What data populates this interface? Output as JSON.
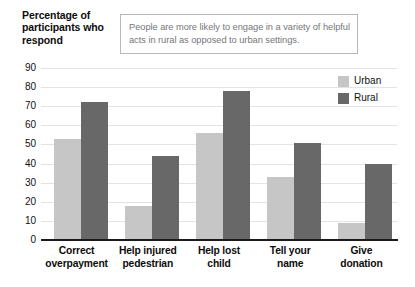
{
  "axis_title": "Percentage of participants who respond",
  "callout": {
    "text": "People are more likely to engage in a variety of helpful acts in rural as opposed to urban settings."
  },
  "legend": {
    "position": "top-right",
    "entries": [
      {
        "label": "Urban",
        "color": "#c6c6c6"
      },
      {
        "label": "Rural",
        "color": "#686868"
      }
    ]
  },
  "chart_data": {
    "type": "bar",
    "title": "",
    "xlabel": "",
    "ylabel": "Percentage of participants who respond",
    "ylim": [
      0,
      90
    ],
    "yticks": [
      "0",
      "10",
      "20",
      "30",
      "40",
      "50",
      "60",
      "70",
      "80",
      "90"
    ],
    "ytick_values": [
      0,
      10,
      20,
      30,
      40,
      50,
      60,
      70,
      80,
      90
    ],
    "grid": true,
    "categories": [
      "Correct overpayment",
      "Help injured pedestrian",
      "Help lost child",
      "Tell your name",
      "Give donation"
    ],
    "category_lines": [
      [
        "Correct",
        "overpayment"
      ],
      [
        "Help injured",
        "pedestrian"
      ],
      [
        "Help lost",
        "child"
      ],
      [
        "Tell your",
        "name"
      ],
      [
        "Give",
        "donation"
      ]
    ],
    "series": [
      {
        "name": "Urban",
        "color": "#c6c6c6",
        "values": [
          53,
          18,
          56,
          33,
          9
        ]
      },
      {
        "name": "Rural",
        "color": "#686868",
        "values": [
          72,
          44,
          78,
          51,
          40
        ]
      }
    ],
    "annotation": "People are more likely to engage in a variety of helpful acts in rural as opposed to urban settings."
  }
}
